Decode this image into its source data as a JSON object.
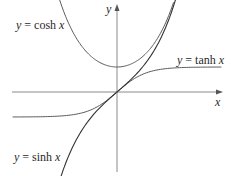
{
  "diagram": {
    "type": "function-graph",
    "axes": {
      "x_label": "x",
      "y_label": "y",
      "origin_px": [
        117,
        92
      ],
      "scale_px_per_unit": {
        "x": 29,
        "y": 25
      }
    },
    "curves": [
      {
        "id": "cosh",
        "label_prefix": "y = cosh ",
        "label_var": "x",
        "function": "cosh",
        "domain": [
          -2.0,
          1.95
        ],
        "label_pos": [
          16,
          28
        ]
      },
      {
        "id": "tanh",
        "label_prefix": "y = tanh ",
        "label_var": "x",
        "function": "tanh",
        "domain": [
          -3.6,
          3.6
        ],
        "label_pos": [
          178,
          64
        ]
      },
      {
        "id": "sinh",
        "label_prefix": "y = sinh ",
        "label_var": "x",
        "function": "sinh",
        "domain": [
          -2.1,
          2.05
        ],
        "label_pos": [
          14,
          160
        ]
      }
    ]
  }
}
